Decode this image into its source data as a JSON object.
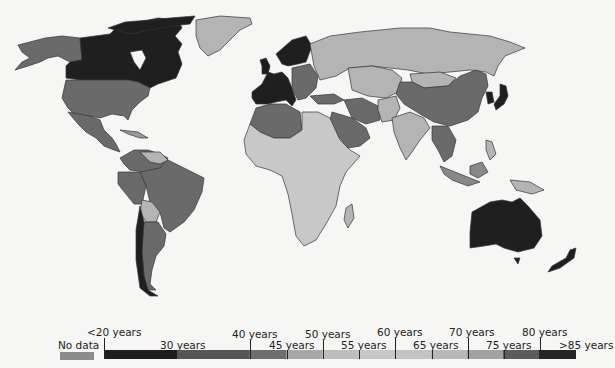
{
  "legend": {
    "no_data": {
      "label": "No data",
      "color": "#8c8c8c"
    },
    "scale": [
      {
        "label": "<20 years",
        "tier": "top",
        "color": "#1e1e1e"
      },
      {
        "label": "30 years",
        "tier": "bottom",
        "color": "#1e1e1e"
      },
      {
        "label": "40 years",
        "tier": "top",
        "color": "#555555"
      },
      {
        "label": "45 years",
        "tier": "bottom",
        "color": "#6e6e6e"
      },
      {
        "label": "50 years",
        "tier": "top",
        "color": "#a8a8a8"
      },
      {
        "label": "55 years",
        "tier": "bottom",
        "color": "#bdbdbd"
      },
      {
        "label": "60 years",
        "tier": "top",
        "color": "#c8c8c8"
      },
      {
        "label": "65 years",
        "tier": "bottom",
        "color": "#c2c2c2"
      },
      {
        "label": "70 years",
        "tier": "top",
        "color": "#b0b0b0"
      },
      {
        "label": "75 years",
        "tier": "bottom",
        "color": "#9c9c9c"
      },
      {
        "label": "80 years",
        "tier": "top",
        "color": "#5a5a5a"
      },
      {
        "label": ">85 years",
        "tier": "bottom",
        "color": "#262626"
      }
    ]
  },
  "regions": [
    {
      "name": "Canada",
      "shade": "darkest"
    },
    {
      "name": "Western Europe",
      "shade": "darkest"
    },
    {
      "name": "Australia",
      "shade": "darkest"
    },
    {
      "name": "Japan",
      "shade": "darkest"
    },
    {
      "name": "Chile",
      "shade": "darkest"
    },
    {
      "name": "United States",
      "shade": "dark"
    },
    {
      "name": "Mexico",
      "shade": "dark"
    },
    {
      "name": "China",
      "shade": "dark"
    },
    {
      "name": "Brazil",
      "shade": "dark"
    },
    {
      "name": "Argentina",
      "shade": "dark"
    },
    {
      "name": "Russia",
      "shade": "light"
    },
    {
      "name": "Greenland",
      "shade": "light"
    },
    {
      "name": "Africa",
      "shade": "lightest"
    },
    {
      "name": "India",
      "shade": "light"
    }
  ]
}
